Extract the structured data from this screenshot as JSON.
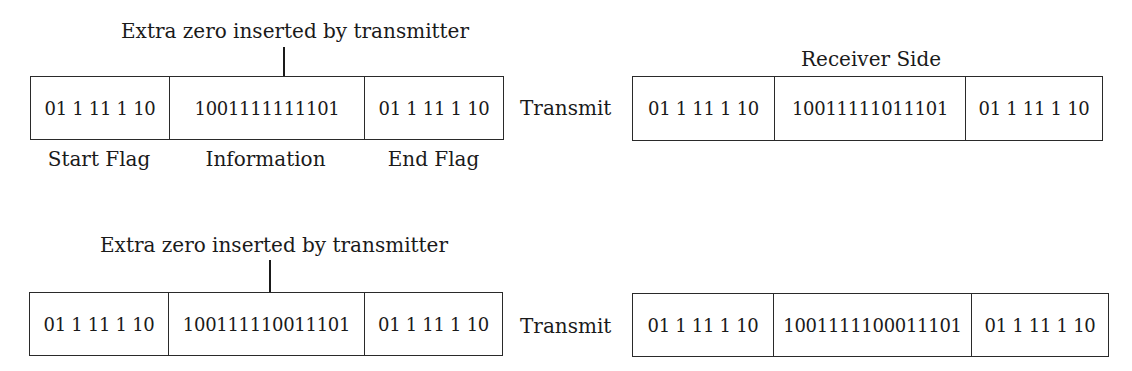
{
  "diagram": {
    "topic": "HDLC bit stuffing",
    "row1": {
      "annotation": "Extra zero inserted by transmitter",
      "sender_frame": {
        "start_flag": "01 1 11 1 10",
        "information": "1001111111101",
        "end_flag": "01 1 11 1 10"
      },
      "field_labels": {
        "start_flag": "Start Flag",
        "information": "Information",
        "end_flag": "End Flag"
      },
      "transmit_label": "Transmit",
      "receiver_heading": "Receiver Side",
      "receiver_frame": {
        "start_flag": "01 1 11 1 10",
        "information": "10011111011101",
        "end_flag": "01 1 11 1 10"
      }
    },
    "row2": {
      "annotation": "Extra zero inserted by transmitter",
      "sender_frame": {
        "start_flag": "01 1 11 1 10",
        "information": "100111110011101",
        "end_flag": "01 1 11 1 10"
      },
      "transmit_label": "Transmit",
      "receiver_frame": {
        "start_flag": "01 1 11 1 10",
        "information": "1001111100011101",
        "end_flag": "01 1 11 1 10"
      }
    },
    "colors": {
      "line": "#2a2a2a",
      "text": "#1a1a1a",
      "background": "#ffffff"
    }
  }
}
